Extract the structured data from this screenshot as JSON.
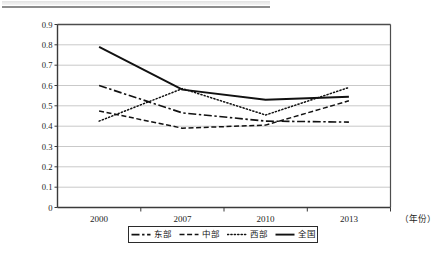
{
  "figure": {
    "name": "regional-index-line-chart",
    "top_rule_present": true
  },
  "axes": {
    "x_axis_title": "（年份）",
    "y_ticks": [
      "0.9",
      "0.8",
      "0.7",
      "0.6",
      "0.5",
      "0.4",
      "0.3",
      "0.2",
      "0.1",
      "0"
    ],
    "x_ticks": [
      "2000",
      "2007",
      "2010",
      "2013"
    ]
  },
  "legend": {
    "items": [
      {
        "label": "东部",
        "style": "dash-dot",
        "color": "#111111"
      },
      {
        "label": "中部",
        "style": "dashed",
        "color": "#111111"
      },
      {
        "label": "西部",
        "style": "dotted",
        "color": "#111111"
      },
      {
        "label": "全国",
        "style": "solid",
        "color": "#111111"
      }
    ]
  },
  "chart_data": {
    "type": "line",
    "title": "",
    "xlabel": "（年份）",
    "ylabel": "",
    "categories": [
      "2000",
      "2007",
      "2010",
      "2013"
    ],
    "ylim": [
      0,
      0.9
    ],
    "yticks": [
      0,
      0.1,
      0.2,
      0.3,
      0.4,
      0.5,
      0.6,
      0.7,
      0.8,
      0.9
    ],
    "grid": "horizontal",
    "legend_position": "bottom",
    "series": [
      {
        "name": "东部",
        "style": "dash-dot",
        "values": [
          0.6,
          0.465,
          0.425,
          0.42
        ]
      },
      {
        "name": "中部",
        "style": "dashed",
        "values": [
          0.475,
          0.39,
          0.405,
          0.525
        ]
      },
      {
        "name": "西部",
        "style": "dotted",
        "values": [
          0.425,
          0.585,
          0.455,
          0.59
        ]
      },
      {
        "name": "全国",
        "style": "solid",
        "values": [
          0.79,
          0.58,
          0.53,
          0.545
        ]
      }
    ]
  }
}
